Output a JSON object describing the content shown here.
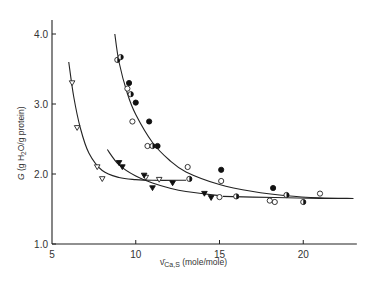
{
  "chart_data": {
    "type": "scatter",
    "title": "",
    "xlabel": "ν̄Ca,S (mole/mole)",
    "xlabel_parts": {
      "symbol": "ν̄",
      "subscript": "Ca,S",
      "units": "(mole/mole)"
    },
    "ylabel": "G (g H2O/g protein)",
    "ylabel_parts": {
      "symbol": "G",
      "pre": "(g H",
      "sub": "2",
      "post": "O/g protein)"
    },
    "xlim": [
      5,
      23.2
    ],
    "ylim": [
      1.0,
      4.2
    ],
    "x_ticks": [
      5,
      10,
      15,
      20
    ],
    "x_tick_labels": [
      "5",
      "10",
      "15",
      "20"
    ],
    "y_ticks": [
      1.0,
      2.0,
      3.0,
      4.0
    ],
    "y_tick_labels": [
      "1.0",
      "2.0",
      "3.0",
      "4.0"
    ],
    "grid": false,
    "legend": null,
    "series": [
      {
        "name": "open circles",
        "marker": "open-circle",
        "points": [
          [
            9.5,
            3.22
          ],
          [
            9.8,
            2.75
          ],
          [
            10.7,
            2.4
          ],
          [
            13.1,
            2.1
          ],
          [
            15.1,
            1.9
          ],
          [
            15.0,
            1.67
          ],
          [
            18.0,
            1.62
          ],
          [
            18.3,
            1.6
          ],
          [
            21.0,
            1.72
          ]
        ]
      },
      {
        "name": "filled circles",
        "marker": "filled-circle",
        "points": [
          [
            9.6,
            3.3
          ],
          [
            10.0,
            3.02
          ],
          [
            10.8,
            2.75
          ],
          [
            11.3,
            2.4
          ],
          [
            15.1,
            2.06
          ],
          [
            18.2,
            1.8
          ]
        ]
      },
      {
        "name": "half-filled circles",
        "marker": "half-circle",
        "points": [
          [
            8.9,
            3.63
          ],
          [
            9.1,
            3.67
          ],
          [
            9.7,
            3.14
          ],
          [
            11.0,
            2.4
          ],
          [
            13.2,
            1.93
          ],
          [
            16.0,
            1.68
          ],
          [
            19.0,
            1.7
          ],
          [
            20.0,
            1.6
          ]
        ]
      },
      {
        "name": "open triangles",
        "marker": "open-triangle",
        "points": [
          [
            6.2,
            3.3
          ],
          [
            6.5,
            2.66
          ],
          [
            7.7,
            2.1
          ],
          [
            8.0,
            1.93
          ],
          [
            10.6,
            1.95
          ],
          [
            11.4,
            1.92
          ]
        ]
      },
      {
        "name": "filled triangles",
        "marker": "filled-triangle",
        "points": [
          [
            9.0,
            2.16
          ],
          [
            9.2,
            2.1
          ],
          [
            10.5,
            1.98
          ],
          [
            11.0,
            1.8
          ],
          [
            12.2,
            1.87
          ],
          [
            14.1,
            1.72
          ],
          [
            14.5,
            1.66
          ]
        ]
      }
    ],
    "curves": [
      {
        "name": "upper circle fit",
        "points": [
          [
            8.75,
            4.0
          ],
          [
            9.0,
            3.6
          ],
          [
            9.5,
            3.15
          ],
          [
            10.0,
            2.85
          ],
          [
            11.0,
            2.45
          ],
          [
            12.0,
            2.2
          ],
          [
            13.0,
            2.03
          ],
          [
            15.0,
            1.85
          ],
          [
            17.0,
            1.75
          ],
          [
            19.0,
            1.69
          ],
          [
            21.0,
            1.66
          ],
          [
            23.0,
            1.65
          ]
        ]
      },
      {
        "name": "open-triangle fit",
        "points": [
          [
            6.0,
            3.6
          ],
          [
            6.3,
            3.1
          ],
          [
            6.7,
            2.65
          ],
          [
            7.2,
            2.3
          ],
          [
            8.0,
            2.05
          ],
          [
            9.0,
            1.95
          ],
          [
            10.0,
            1.92
          ],
          [
            11.0,
            1.91
          ],
          [
            13.0,
            1.91
          ]
        ]
      },
      {
        "name": "filled-triangle fit",
        "points": [
          [
            8.3,
            2.35
          ],
          [
            9.0,
            2.13
          ],
          [
            10.0,
            1.97
          ],
          [
            11.0,
            1.87
          ],
          [
            12.0,
            1.8
          ],
          [
            13.0,
            1.75
          ],
          [
            15.0,
            1.69
          ]
        ]
      },
      {
        "name": "lower circle fit",
        "points": [
          [
            15.2,
            1.68
          ],
          [
            17.0,
            1.67
          ],
          [
            19.0,
            1.66
          ],
          [
            21.0,
            1.65
          ],
          [
            22.8,
            1.65
          ]
        ]
      }
    ]
  }
}
